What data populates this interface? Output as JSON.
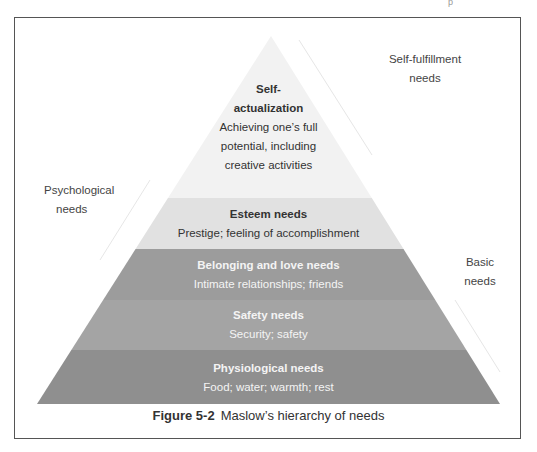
{
  "diagram": {
    "type": "pyramid",
    "colors": {
      "self_actualization": "#f1f1f1",
      "esteem": "#e0e0e0",
      "belonging": "#9a9a9a",
      "safety": "#a3a3a3",
      "physiological": "#8e8e8e",
      "frame": "#555555"
    },
    "levels": [
      {
        "id": "self_actualization",
        "title_line1": "Self-",
        "title_line2": "actualization",
        "desc_line1": "Achieving one’s full",
        "desc_line2": "potential, including",
        "desc_line3": "creative activities"
      },
      {
        "id": "esteem",
        "title": "Esteem needs",
        "desc": "Prestige; feeling of accomplishment"
      },
      {
        "id": "belonging",
        "title": "Belonging and love needs",
        "desc": "Intimate relationships; friends"
      },
      {
        "id": "safety",
        "title": "Safety needs",
        "desc": "Security; safety"
      },
      {
        "id": "physiological",
        "title": "Physiological needs",
        "desc": "Food; water; warmth; rest"
      }
    ],
    "side_labels": {
      "self_fulfillment": {
        "line1": "Self-fulfillment",
        "line2": "needs"
      },
      "psychological": {
        "line1": "Psychological",
        "line2": "needs"
      },
      "basic": {
        "line1": "Basic",
        "line2": "needs"
      }
    }
  },
  "caption": {
    "figure_number": "Figure 5-2",
    "text": "Maslow’s hierarchy of needs"
  },
  "page_artifact": "p"
}
